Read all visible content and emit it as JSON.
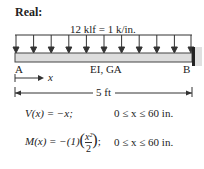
{
  "title": "Real:",
  "load_label": "12 klf = 1 k/in.",
  "support_a": "A",
  "support_b": "B",
  "beam_props": "EI, GA",
  "x_axis_label": "x",
  "span_label": "5 ft",
  "equations": [
    {
      "lhs": "V(x) = −x;",
      "range": "0 ≤ x ≤ 60 in."
    },
    {
      "lhs_prefix": "M(x) = −(1)",
      "num": "x²",
      "den": "2",
      "lhs_suffix": ";",
      "range": "0 ≤ x ≤ 60 in."
    }
  ],
  "arrow_count": 11
}
